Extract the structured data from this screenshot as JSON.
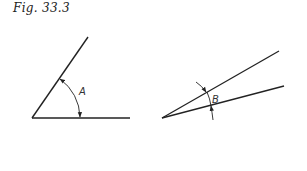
{
  "figure": {
    "caption": "Fig. 33.3",
    "angles": [
      {
        "label": "A",
        "type": "obtuse-acute opening angle with arc dimension inside"
      },
      {
        "label": "B",
        "type": "small acute angle with arrows pointing inward from outside"
      }
    ]
  },
  "colors": {
    "line": "#222222",
    "background": "#ffffff"
  }
}
